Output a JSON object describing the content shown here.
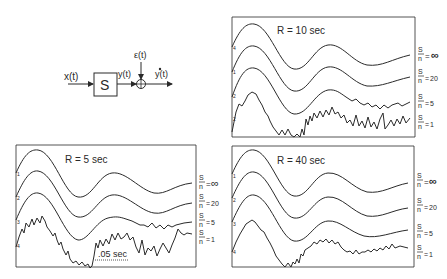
{
  "block_diagram": {
    "input_label": "x(t)",
    "system_label": "S",
    "output_label": "y(t)",
    "noise_label": "ε(t)",
    "measured_label": "y*(t)",
    "sum_symbol": "+"
  },
  "panels": [
    {
      "title": "R = 10 sec",
      "trace_numbers": [
        "4",
        "1",
        "2",
        "2"
      ],
      "sn_labels": [
        "∞",
        "20",
        "5",
        "1"
      ]
    },
    {
      "title": "R = 5 sec",
      "trace_numbers": [
        "1",
        "2",
        "3",
        "4"
      ],
      "sn_labels": [
        "∞",
        "20",
        "5",
        "1"
      ],
      "scale_bar": ".05 sec"
    },
    {
      "title": "R = 40 sec",
      "trace_numbers": [
        "1",
        "2",
        "3",
        "4"
      ],
      "sn_labels": [
        "∞",
        "20",
        "5",
        "1"
      ]
    }
  ],
  "sn_ratio": {
    "numerator": "S",
    "denominator": "n"
  },
  "colors": {
    "ink": "#2a2a2a",
    "background": "#ffffff"
  }
}
